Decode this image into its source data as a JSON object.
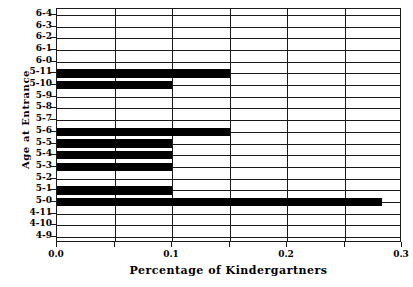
{
  "chart_data": {
    "type": "bar",
    "orientation": "horizontal",
    "title": "",
    "xlabel": "Percentage of Kindergartners",
    "ylabel": "Age at Entrance",
    "xlim": [
      0.0,
      0.3
    ],
    "grid": true,
    "legend": null,
    "bar_color": "#000000",
    "axis_color": "#1a1a1a",
    "background": "#ffffff",
    "xticks": [
      {
        "value": 0.0,
        "label": "0.0",
        "major": true
      },
      {
        "value": 0.05,
        "label": "",
        "major": false
      },
      {
        "value": 0.1,
        "label": "0.1",
        "major": true
      },
      {
        "value": 0.15,
        "label": "",
        "major": false
      },
      {
        "value": 0.2,
        "label": "0.2",
        "major": true
      },
      {
        "value": 0.25,
        "label": "",
        "major": false
      },
      {
        "value": 0.3,
        "label": "0.3",
        "major": true
      }
    ],
    "categories": [
      "6-4",
      "6-3",
      "6-2",
      "6-1",
      "6-0",
      "5-11",
      "5-10",
      "5-9",
      "5-8",
      "5-7",
      "5-6",
      "5-5",
      "5-4",
      "5-3",
      "5-2",
      "5-1",
      "5-0",
      "4-11",
      "4-10",
      "4-9"
    ],
    "values": [
      0.0,
      0.0,
      0.0,
      0.0,
      0.0,
      0.15,
      0.1,
      0.0,
      0.0,
      0.0,
      0.15,
      0.1,
      0.1,
      0.1,
      0.0,
      0.1,
      0.283,
      0.0,
      0.0,
      0.0
    ]
  }
}
